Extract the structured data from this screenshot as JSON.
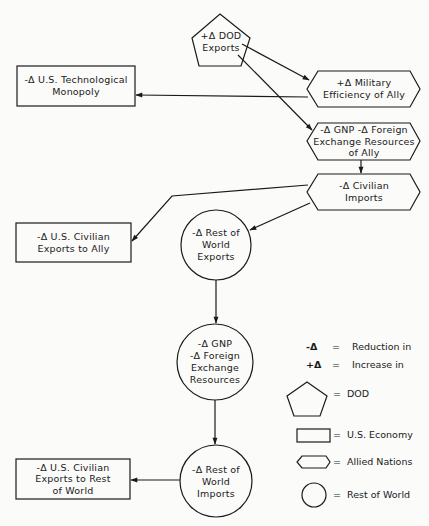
{
  "nodes": {
    "dod_exports": {
      "shape": "pentagon",
      "category": "DOD",
      "label": "+Δ DOD\nExports"
    },
    "military_efficiency": {
      "shape": "hexagon",
      "category": "Allied Nations",
      "label": "+Δ Military\nEfficiency of Ally"
    },
    "tech_monopoly": {
      "shape": "rectangle",
      "category": "U.S. Economy",
      "label": "-Δ U.S. Technological\nMonopoly"
    },
    "gnp_ally": {
      "shape": "hexagon",
      "category": "Allied Nations",
      "label": "-Δ GNP  -Δ Foreign\nExchange Resources\nof Ally"
    },
    "civilian_imports": {
      "shape": "hexagon",
      "category": "Allied Nations",
      "label": "-Δ Civilian\nImports"
    },
    "us_exports_ally": {
      "shape": "rectangle",
      "category": "U.S. Economy",
      "label": "-Δ U.S. Civilian\nExports to Ally"
    },
    "row_exports": {
      "shape": "circle",
      "category": "Rest of World",
      "label": "-Δ Rest of\nWorld\nExports"
    },
    "row_gnp": {
      "shape": "circle",
      "category": "Rest of World",
      "label": "-Δ GNP\n-Δ Foreign\nExchange\nResources"
    },
    "row_imports": {
      "shape": "circle",
      "category": "Rest of World",
      "label": "-Δ Rest of\nWorld\nImports"
    },
    "us_exports_row": {
      "shape": "rectangle",
      "category": "U.S. Economy",
      "label": "-Δ U.S. Civilian\nExports to Rest\nof World"
    }
  },
  "edges": [
    {
      "from": "dod_exports",
      "to": "military_efficiency"
    },
    {
      "from": "dod_exports",
      "to": "gnp_ally"
    },
    {
      "from": "military_efficiency",
      "to": "tech_monopoly"
    },
    {
      "from": "gnp_ally",
      "to": "civilian_imports"
    },
    {
      "from": "civilian_imports",
      "to": "us_exports_ally"
    },
    {
      "from": "civilian_imports",
      "to": "row_exports"
    },
    {
      "from": "row_exports",
      "to": "row_gnp"
    },
    {
      "from": "row_gnp",
      "to": "row_imports"
    },
    {
      "from": "row_imports",
      "to": "us_exports_row"
    }
  ],
  "legend": {
    "minus_delta": {
      "symbol": "-Δ",
      "eq": "=",
      "meaning": "Reduction in"
    },
    "plus_delta": {
      "symbol": "+Δ",
      "eq": "=",
      "meaning": "Increase in"
    },
    "pentagon": {
      "eq": "=",
      "meaning": "DOD"
    },
    "rectangle": {
      "eq": "=",
      "meaning": "U.S. Economy"
    },
    "hexagon": {
      "eq": "=",
      "meaning": "Allied Nations"
    },
    "circle": {
      "eq": "=",
      "meaning": "Rest of World"
    }
  },
  "colors": {
    "stroke": "#1a1a1a",
    "background": "#fbfbf9"
  }
}
